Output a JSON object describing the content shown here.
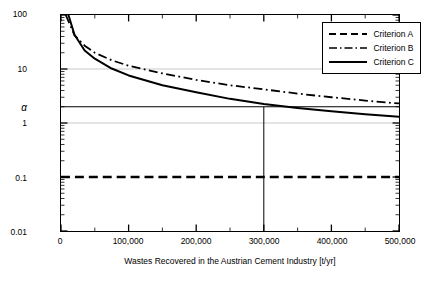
{
  "chart_data": {
    "type": "line",
    "title": "",
    "xlabel": "Wastes Recovered in the Austrian Cement Industry [t/yr]",
    "ylabel": "Mercury concentration [mg/kg]",
    "xlim": [
      0,
      500000
    ],
    "ylim": [
      0.01,
      100
    ],
    "yscale": "log",
    "xticks": [
      0,
      100000,
      200000,
      300000,
      400000,
      500000
    ],
    "xtick_labels": [
      "0",
      "100,000",
      "200,000",
      "300,000",
      "400,000",
      "500,000"
    ],
    "yticks": [
      0.01,
      0.1,
      1,
      10,
      100
    ],
    "ytick_labels": [
      "0.01",
      "0.1",
      "1",
      "10",
      "100"
    ],
    "grid": "horizontal gridlines at 10 and 1 (light gray)",
    "legend_position": "top-right",
    "annotations": [
      {
        "name": "alpha",
        "label": "α",
        "axis": "y",
        "value": 2.0
      },
      {
        "name": "alpha-horizontal-line",
        "type": "hline",
        "y": 2.0
      },
      {
        "name": "operating-point-vertical-line",
        "type": "vline",
        "x": 300000
      }
    ],
    "series": [
      {
        "name": "Criterion A",
        "style": "dashed",
        "color": "#000000",
        "x": [
          0,
          500000
        ],
        "values": [
          0.1,
          0.1
        ]
      },
      {
        "name": "Criterion B",
        "style": "dash-dot",
        "color": "#000000",
        "x": [
          7000,
          20000,
          35000,
          50000,
          75000,
          100000,
          150000,
          200000,
          250000,
          300000,
          350000,
          400000,
          450000,
          500000
        ],
        "values": [
          100,
          42,
          27,
          20,
          14.5,
          11.5,
          8.3,
          6.3,
          5.0,
          4.2,
          3.5,
          3.0,
          2.6,
          2.3
        ]
      },
      {
        "name": "Criterion C",
        "style": "solid",
        "color": "#000000",
        "x": [
          11000,
          20000,
          35000,
          50000,
          75000,
          100000,
          150000,
          200000,
          250000,
          300000,
          350000,
          400000,
          450000,
          500000
        ],
        "values": [
          100,
          43,
          22,
          15.5,
          10.2,
          7.6,
          5.0,
          3.7,
          2.8,
          2.25,
          1.9,
          1.65,
          1.45,
          1.3
        ]
      }
    ]
  },
  "legend": {
    "items": [
      {
        "label": "Criterion A",
        "style": "dashed"
      },
      {
        "label": "Criterion B",
        "style": "dash-dot"
      },
      {
        "label": "Criterion C",
        "style": "solid"
      }
    ]
  }
}
